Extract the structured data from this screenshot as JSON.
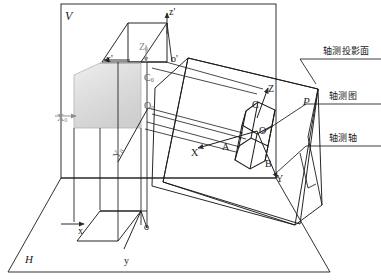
{
  "figure": {
    "kind": "descriptive-geometry-axonometric-projection-diagram",
    "background_color": "#ffffff",
    "line_color": "#1a1a1a",
    "faint_line_color": "#8f8f8f",
    "shaded_face_color": "#d9d9d9"
  },
  "planes": {
    "vertical_plane_label": "V",
    "horizontal_plane_label": "H",
    "axonometric_plane_label": "P"
  },
  "front_view_axes": {
    "z_label": "z'",
    "x_label": "x'",
    "origin_label": "o'"
  },
  "top_view_axes": {
    "x_label": "x",
    "y_label": "y",
    "origin_label": "o"
  },
  "object_axes": {
    "z_label": "Z",
    "x_label": "X",
    "y_label": "Y",
    "origin_label": "O"
  },
  "object_axes_sub": {
    "z_label": "Z",
    "z_sub": "0",
    "x_label": "X",
    "x_sub": "0",
    "y_label": "Y",
    "y_sub": "0",
    "origin_label": "O",
    "origin_sub": "0",
    "c_label": "C",
    "c_sub": "0"
  },
  "vertices": {
    "a": "A",
    "b": "B",
    "c": "C",
    "o": "O"
  },
  "annotations": [
    {
      "id": "axonometric-projection-plane",
      "text": "轴测投影面"
    },
    {
      "id": "axonometric-drawing",
      "text": "轴测图"
    },
    {
      "id": "axonometric-axes",
      "text": "轴测轴"
    }
  ]
}
